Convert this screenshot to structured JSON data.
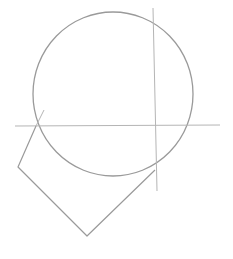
{
  "image": {
    "description": "Pencil construction sketch of a head: circle for cranium, horizontal and vertical guide lines, and angular jaw shape",
    "width": 233,
    "height": 259,
    "background": "#ffffff",
    "stroke_color": "#9a9a9a",
    "guide_color": "#b5b5b5"
  },
  "shapes": {
    "cranium_circle": {
      "cx": 113,
      "cy": 94,
      "rx": 80,
      "ry": 82
    },
    "horizontal_guide": {
      "x1": 15,
      "y1": 126,
      "x2": 220,
      "y2": 125
    },
    "vertical_guide": {
      "x1": 153,
      "y1": 8,
      "x2": 157,
      "y2": 191
    },
    "tick_mark": {
      "x1": 36,
      "y1": 126,
      "x2": 44,
      "y2": 110
    },
    "jaw_polygon": {
      "points": "36,126 18,167 87,236 155,170"
    }
  }
}
